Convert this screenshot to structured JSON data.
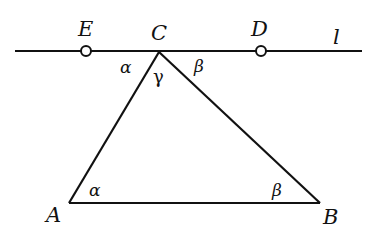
{
  "diagram": {
    "type": "geometry",
    "line": {
      "label": "l",
      "x1": 15,
      "y1": 51,
      "x2": 362,
      "y2": 51
    },
    "points": {
      "E": {
        "label": "E",
        "x": 86,
        "y": 51,
        "marker": "open-circle"
      },
      "C": {
        "label": "C",
        "x": 159,
        "y": 52
      },
      "D": {
        "label": "D",
        "x": 261,
        "y": 51,
        "marker": "open-circle"
      },
      "A": {
        "label": "A",
        "x": 69,
        "y": 203
      },
      "B": {
        "label": "B",
        "x": 320,
        "y": 203
      }
    },
    "triangle": [
      "A",
      "B",
      "C"
    ],
    "angles": {
      "alpha_top": {
        "label": "α",
        "at": "C",
        "between": "E-C-A"
      },
      "gamma": {
        "label": "γ",
        "at": "C",
        "between": "A-C-B"
      },
      "beta_top": {
        "label": "β",
        "at": "C",
        "between": "B-C-D"
      },
      "alpha_bottom": {
        "label": "α",
        "at": "A",
        "between": "C-A-B"
      },
      "beta_bottom": {
        "label": "β",
        "at": "B",
        "between": "A-B-C"
      }
    },
    "stroke_color": "#111111"
  }
}
